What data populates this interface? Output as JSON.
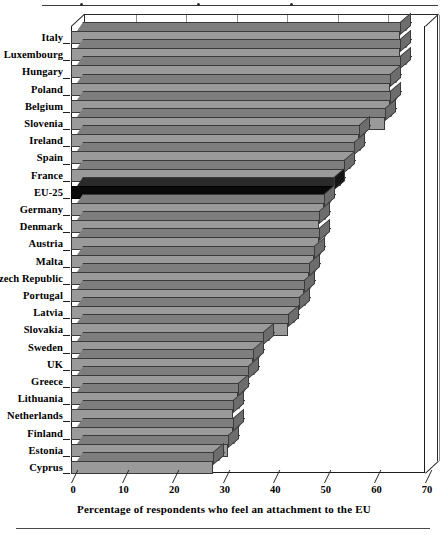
{
  "chart_data": {
    "type": "bar",
    "orientation": "horizontal",
    "title": "",
    "xlabel": "Percentage of respondents who feel an attachment to the EU",
    "ylabel": "",
    "xlim": [
      0,
      70
    ],
    "xticks": [
      0,
      10,
      20,
      30,
      40,
      50,
      60,
      70
    ],
    "grid": true,
    "legend": false,
    "highlight_category": "EU-25",
    "highlight_color": "#0a0a0a",
    "bar_color": "#9a9a9a",
    "categories": [
      "Italy",
      "Luxembourg",
      "Hungary",
      "Poland",
      "Belgium",
      "Slovenia",
      "Ireland",
      "Spain",
      "France",
      "EU-25",
      "Germany",
      "Denmark",
      "Austria",
      "Malta",
      "Czech Republic",
      "Portugal",
      "Latvia",
      "Slovakia",
      "Sweden",
      "UK",
      "Greece",
      "Lithuania",
      "Netherlands",
      "Finland",
      "Estonia",
      "Cyprus"
    ],
    "values": [
      65,
      65,
      65,
      63,
      63,
      62,
      57,
      56,
      54,
      52,
      50,
      49,
      49,
      48,
      47,
      46,
      45,
      43,
      38,
      36,
      35,
      33,
      32,
      32,
      31,
      28
    ]
  },
  "axis": {
    "tick_labels": [
      "0",
      "10",
      "20",
      "30",
      "40",
      "50",
      "60",
      "70"
    ]
  },
  "caption": {
    "text": "Percentage of respondents who feel an attachment to the EU"
  }
}
